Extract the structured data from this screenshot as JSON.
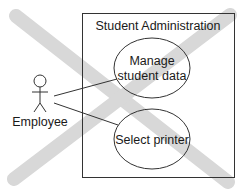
{
  "diagram": {
    "type": "uml-use-case",
    "system_boundary": {
      "title": "Student Administration"
    },
    "actor": {
      "label": "Employee",
      "icon": "stick-figure-icon"
    },
    "use_cases": [
      {
        "label_lines": [
          "Manage",
          "student data"
        ]
      },
      {
        "label_lines": [
          "Select printer"
        ]
      }
    ],
    "overlay": {
      "type": "cross-out",
      "color": "#d4d4d4"
    },
    "colors": {
      "line": "#333333",
      "background": "#ffffff"
    }
  }
}
